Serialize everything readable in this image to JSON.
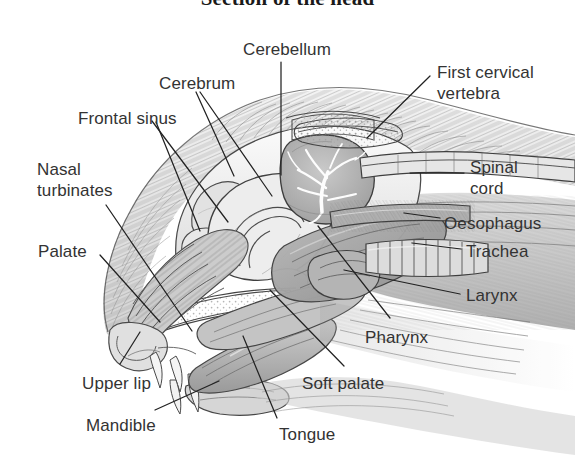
{
  "figure": {
    "title": "Section of the head",
    "title_clipped": true,
    "background_color": "#ffffff",
    "ink_color": "#333333",
    "medium": "pencil-stipple-anatomical-illustration",
    "width": 575,
    "height": 463
  },
  "labels": [
    {
      "id": "cerebellum",
      "text": "Cerebellum",
      "x": 243,
      "y": 39,
      "align": "left"
    },
    {
      "id": "cerebrum",
      "text": "Cerebrum",
      "x": 159,
      "y": 73,
      "align": "left"
    },
    {
      "id": "first-cervical-vertebra",
      "text": "First cervical\nvertebra",
      "x": 437,
      "y": 62,
      "align": "left"
    },
    {
      "id": "frontal-sinus",
      "text": "Frontal sinus",
      "x": 78,
      "y": 108,
      "align": "left"
    },
    {
      "id": "nasal-turbinates",
      "text": "Nasal\nturbinates",
      "x": 37,
      "y": 159,
      "align": "left"
    },
    {
      "id": "spinal-cord",
      "text": "Spinal\ncord",
      "x": 470,
      "y": 157,
      "align": "left"
    },
    {
      "id": "oesophagus",
      "text": "Oesophagus",
      "x": 444,
      "y": 213,
      "align": "left"
    },
    {
      "id": "palate",
      "text": "Palate",
      "x": 38,
      "y": 241,
      "align": "left"
    },
    {
      "id": "trachea",
      "text": "Trachea",
      "x": 466,
      "y": 241,
      "align": "left"
    },
    {
      "id": "larynx",
      "text": "Larynx",
      "x": 466,
      "y": 285,
      "align": "left"
    },
    {
      "id": "pharynx",
      "text": "Pharynx",
      "x": 365,
      "y": 327,
      "align": "left"
    },
    {
      "id": "upper-lip",
      "text": "Upper lip",
      "x": 82,
      "y": 373,
      "align": "left"
    },
    {
      "id": "soft-palate",
      "text": "Soft palate",
      "x": 302,
      "y": 373,
      "align": "left"
    },
    {
      "id": "mandible",
      "text": "Mandible",
      "x": 86,
      "y": 415,
      "align": "left"
    },
    {
      "id": "tongue",
      "text": "Tongue",
      "x": 279,
      "y": 424,
      "align": "left"
    }
  ],
  "leader_lines": [
    {
      "label": "cerebellum",
      "path": "M 281,62 L 281,175"
    },
    {
      "label": "cerebrum",
      "path": "M 200,92 L 272,196"
    },
    {
      "label": "cerebrum-2",
      "path": "M 196,92 L 234,176"
    },
    {
      "label": "first-cervical-vertebra",
      "path": "M 430,76 L 367,138"
    },
    {
      "label": "frontal-sinus-a",
      "path": "M 152,121 L 228,222"
    },
    {
      "label": "frontal-sinus-b",
      "path": "M 156,122 L 200,231"
    },
    {
      "label": "nasal-turbinates",
      "path": "M 106,205 L 192,331"
    },
    {
      "label": "spinal-cord",
      "path": "M 464,173 L 410,173"
    },
    {
      "label": "oesophagus",
      "path": "M 440,218 L 404,213"
    },
    {
      "label": "palate",
      "path": "M 100,255 L 160,322"
    },
    {
      "label": "trachea",
      "path": "M 461,249 L 412,243"
    },
    {
      "label": "larynx",
      "path": "M 460,294 L 344,270"
    },
    {
      "label": "pharynx",
      "path": "M 390,318 L 318,226"
    },
    {
      "label": "upper-lip",
      "path": "M 120,364 L 140,332"
    },
    {
      "label": "soft-palate",
      "path": "M 344,366 L 270,290"
    },
    {
      "label": "mandible",
      "path": "M 155,410 L 219,381"
    },
    {
      "label": "tongue",
      "path": "M 277,418 L 243,336"
    }
  ],
  "structures": [
    {
      "id": "cerebrum",
      "name": "Cerebrum"
    },
    {
      "id": "cerebellum",
      "name": "Cerebellum (arbor vitae)"
    },
    {
      "id": "frontal-sinus",
      "name": "Frontal sinus"
    },
    {
      "id": "nasal-turbinates",
      "name": "Nasal turbinates"
    },
    {
      "id": "hard-palate",
      "name": "Hard palate"
    },
    {
      "id": "soft-palate",
      "name": "Soft palate"
    },
    {
      "id": "tongue",
      "name": "Tongue"
    },
    {
      "id": "mandible",
      "name": "Mandible"
    },
    {
      "id": "upper-lip",
      "name": "Upper lip"
    },
    {
      "id": "pharynx",
      "name": "Pharynx"
    },
    {
      "id": "larynx",
      "name": "Larynx"
    },
    {
      "id": "trachea",
      "name": "Trachea"
    },
    {
      "id": "oesophagus",
      "name": "Oesophagus"
    },
    {
      "id": "spinal-cord",
      "name": "Spinal cord"
    },
    {
      "id": "atlas",
      "name": "First cervical vertebra"
    }
  ]
}
